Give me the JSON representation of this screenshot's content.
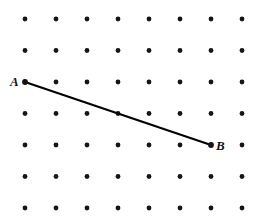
{
  "figure": {
    "type": "dot-lattice-geometry",
    "width": 262,
    "height": 219,
    "background_color": "#ffffff"
  },
  "lattice": {
    "name": "square-dot-grid",
    "columns": 8,
    "rows": 7,
    "origin_x": 25,
    "origin_y": 19,
    "spacing_x": 31,
    "spacing_y": 31.5,
    "dot_radius": 2.4,
    "dot_color": "#151515",
    "column_x": [
      25,
      56,
      87,
      118,
      149,
      180,
      211,
      242
    ],
    "row_y": [
      19,
      50.5,
      82,
      113.5,
      145,
      176.5,
      208
    ]
  },
  "segment": {
    "name": "segment-AB",
    "stroke_color": "#000000",
    "stroke_width": 2.1,
    "endpoints": [
      {
        "label": "A",
        "grid_col": 1,
        "grid_row": 3,
        "x": 25,
        "y": 82
      },
      {
        "label": "B",
        "grid_col": 7,
        "grid_row": 5,
        "x": 211,
        "y": 145
      }
    ],
    "passes_through": [
      {
        "grid_col": 4,
        "grid_row": 4,
        "x": 118,
        "y": 113.5
      }
    ]
  },
  "labels": {
    "a": "A",
    "b": "B"
  }
}
